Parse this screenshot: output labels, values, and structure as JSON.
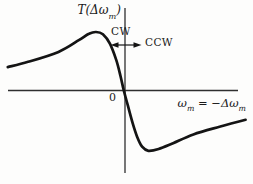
{
  "figure": {
    "background": "#fdfdfc",
    "ink": "#141414",
    "axis_color": "#2f2f2f"
  },
  "labels": {
    "y_axis_pre": "T(Δω",
    "y_axis_sub": "m",
    "y_axis_post": ")",
    "x_axis_pre": "ω",
    "x_axis_sub1": "m",
    "x_axis_mid": " = −Δω",
    "x_axis_sub2": "m",
    "origin": "0",
    "cw": "CW",
    "ccw": "CCW"
  },
  "chart_data": {
    "type": "line",
    "title": "",
    "xlabel": "ω_m = −Δω_m",
    "ylabel": "T(Δω_m)",
    "x_range": [
      -4.1,
      4.2
    ],
    "y_range": [
      -1.15,
      1.15
    ],
    "grid": false,
    "legend": false,
    "axes_numeric_ticks": false,
    "series": [
      {
        "name": "T(Δω_m)",
        "points": [
          [
            -4.0,
            0.4
          ],
          [
            -3.3,
            0.49
          ],
          [
            -2.25,
            0.66
          ],
          [
            -1.55,
            0.86
          ],
          [
            -1.2,
            0.97
          ],
          [
            -0.96,
            1.0
          ],
          [
            -0.72,
            0.96
          ],
          [
            -0.48,
            0.8
          ],
          [
            -0.26,
            0.52
          ],
          [
            -0.12,
            0.26
          ],
          [
            0.0,
            0.0
          ],
          [
            0.14,
            -0.26
          ],
          [
            0.3,
            -0.55
          ],
          [
            0.46,
            -0.79
          ],
          [
            0.63,
            -0.96
          ],
          [
            0.85,
            -1.03
          ],
          [
            1.2,
            -1.0
          ],
          [
            1.7,
            -0.9
          ],
          [
            2.4,
            -0.75
          ],
          [
            3.3,
            -0.62
          ],
          [
            4.2,
            -0.5
          ]
        ]
      }
    ],
    "annotations": [
      {
        "text": "CW",
        "placement": "above double arrow, left of vertical axis"
      },
      {
        "text": "CCW",
        "placement": "right of double arrow"
      },
      {
        "text": "0",
        "placement": "left of origin, below x-axis"
      },
      {
        "shape": "double-headed horizontal arrow crossing vertical axis near curve peak"
      }
    ]
  }
}
